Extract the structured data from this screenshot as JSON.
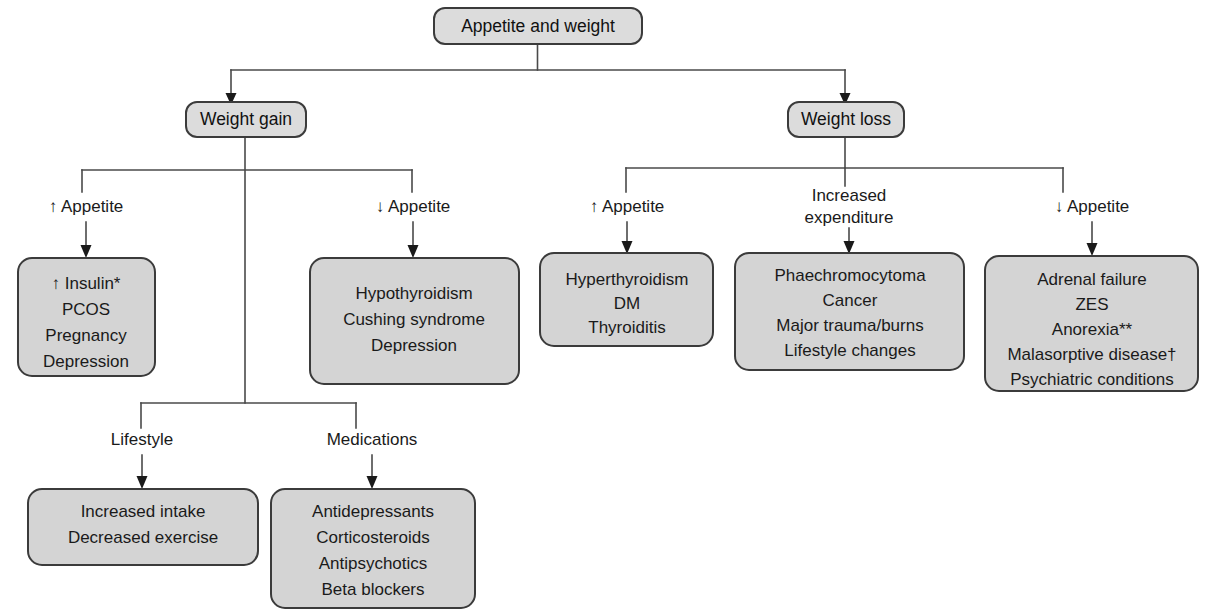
{
  "diagram": {
    "title": "Appetite and weight",
    "root": {
      "id": "root",
      "label": "Appetite and weight"
    },
    "level1": [
      {
        "id": "weight-gain",
        "label": "Weight gain"
      },
      {
        "id": "weight-loss",
        "label": "Weight loss"
      }
    ],
    "edge_labels": {
      "gain_up_appetite": "↑ Appetite",
      "gain_down_appetite": "↓ Appetite",
      "gain_lifestyle": "Lifestyle",
      "gain_medications": "Medications",
      "loss_up_appetite": "↑ Appetite",
      "loss_increased_expenditure_line1": "Increased",
      "loss_increased_expenditure_line2": "expenditure",
      "loss_down_appetite": "↓ Appetite"
    },
    "boxes": {
      "gain_up_appetite": {
        "id": "box-gain-up-appetite",
        "lines": [
          "↑ Insulin*",
          "PCOS",
          "Pregnancy",
          "Depression"
        ]
      },
      "gain_down_appetite": {
        "id": "box-gain-down-appetite",
        "lines": [
          "Hypothyroidism",
          "Cushing syndrome",
          "Depression"
        ]
      },
      "gain_lifestyle": {
        "id": "box-gain-lifestyle",
        "lines": [
          "Increased intake",
          "Decreased exercise"
        ]
      },
      "gain_medications": {
        "id": "box-gain-medications",
        "lines": [
          "Antidepressants",
          "Corticosteroids",
          "Antipsychotics",
          "Beta blockers"
        ]
      },
      "loss_up_appetite": {
        "id": "box-loss-up-appetite",
        "lines": [
          "Hyperthyroidism",
          "DM",
          "Thyroiditis"
        ]
      },
      "loss_increased_expenditure": {
        "id": "box-loss-increased-expenditure",
        "lines": [
          "Phaechromocytoma",
          "Cancer",
          "Major trauma/burns",
          "Lifestyle changes"
        ]
      },
      "loss_down_appetite": {
        "id": "box-loss-down-appetite",
        "lines": [
          "Adrenal failure",
          "ZES",
          "Anorexia**",
          "Malasorptive disease†",
          "Psychiatric conditions"
        ]
      }
    },
    "colors": {
      "box_fill": "#d4d4d4",
      "box_stroke": "#3b3b3b",
      "pill_fill": "#dcdcdc",
      "connector": "#4a4a4a",
      "text": "#1a1a1a",
      "background": "#ffffff"
    }
  }
}
